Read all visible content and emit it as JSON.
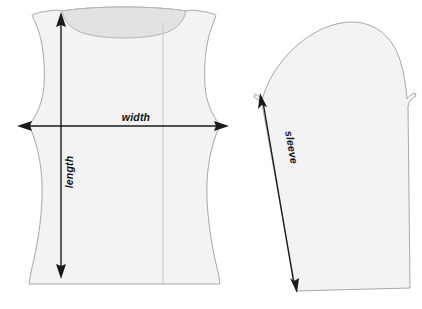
{
  "diagram": {
    "background_color": "#ffffff",
    "piece_fill_color": "#f3f3f3",
    "piece_outline_color": "#a8a8a8",
    "neckline_fill_color": "#e2e2e2",
    "center_line_color": "#c9c9c9",
    "dimension_color": "#1a1a1a"
  },
  "pieces": [
    {
      "name": "bodice-front",
      "label": "Bodice front"
    },
    {
      "name": "sleeve",
      "label": "Sleeve"
    }
  ],
  "dimensions": {
    "width": {
      "label": "width",
      "orientation": "horizontal",
      "arrowheads": "both"
    },
    "length": {
      "label": "length",
      "orientation": "vertical",
      "arrowheads": "both"
    },
    "sleeve": {
      "label": "sleeve",
      "orientation": "diagonal",
      "arrowheads": "both"
    }
  }
}
